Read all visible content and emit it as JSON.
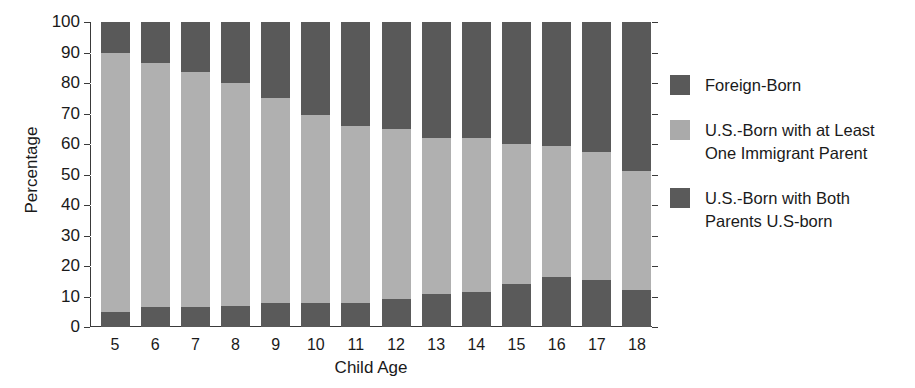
{
  "chart_data": {
    "type": "bar",
    "subtype": "stacked-bar-100",
    "title": "",
    "xlabel": "Child Age",
    "ylabel": "Percentage",
    "categories": [
      "5",
      "6",
      "7",
      "8",
      "9",
      "10",
      "11",
      "12",
      "13",
      "14",
      "15",
      "16",
      "17",
      "18"
    ],
    "ylim": [
      0,
      100
    ],
    "yticks": [
      "0",
      "10",
      "20",
      "30",
      "40",
      "50",
      "60",
      "70",
      "80",
      "90",
      "100"
    ],
    "grid": true,
    "legend_position": "right",
    "series": [
      {
        "name": "U.S.-Born with Both\nParents U.S-born",
        "color": "#5a5a5a",
        "values": [
          5,
          6.5,
          6.5,
          7,
          7.8,
          7.8,
          8,
          9.2,
          10.8,
          11.5,
          14,
          16.3,
          15.5,
          12
        ]
      },
      {
        "name": "U.S.-Born with at Least\nOne Immigrant Parent",
        "color": "#b0b0b0",
        "values": [
          85,
          80,
          77,
          73,
          67.2,
          61.7,
          58,
          55.8,
          51.2,
          50.5,
          46,
          43.2,
          42,
          39
        ]
      },
      {
        "name": "Foreign-Born",
        "color": "#595959",
        "values": [
          10,
          13.5,
          16.5,
          20,
          25,
          30.5,
          34,
          35,
          38,
          38,
          40,
          40.5,
          42.5,
          49
        ]
      }
    ],
    "stack_tops": {
      "bottom_segment": [
        5,
        6.5,
        6.5,
        7,
        7.8,
        7.8,
        8,
        9.2,
        10.8,
        11.5,
        14,
        16.3,
        15.5,
        12
      ],
      "middle_segment": [
        90,
        86.5,
        83.5,
        80,
        75,
        69.5,
        66,
        65,
        62,
        62,
        60,
        59.5,
        57.5,
        51
      ]
    }
  },
  "legend": {
    "entries": [
      {
        "label": "Foreign-Born",
        "color": "#595959"
      },
      {
        "label": "U.S.-Born with at Least\nOne Immigrant Parent",
        "color": "#aaaaaa"
      },
      {
        "label": "U.S.-Born with Both\nParents U.S-born",
        "color": "#5a5a5a"
      }
    ]
  },
  "axes": {
    "y_title": "Percentage",
    "x_title": "Child Age"
  }
}
